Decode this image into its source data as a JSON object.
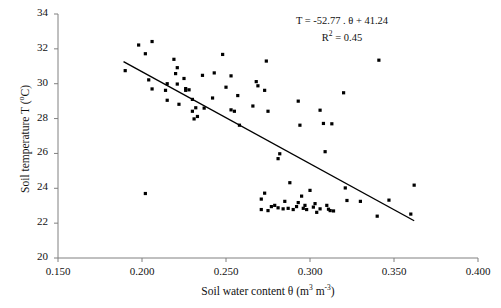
{
  "chart_data": {
    "type": "scatter",
    "title": "",
    "xlabel": "Soil water content θ (m³ m⁻³)",
    "ylabel": "Soil temperature T (ºC)",
    "xlim": [
      0.15,
      0.4
    ],
    "ylim": [
      20,
      34
    ],
    "xticks": [
      "0.150",
      "0.200",
      "0.250",
      "0.300",
      "0.350",
      "0.400"
    ],
    "xtick_values": [
      0.15,
      0.2,
      0.25,
      0.3,
      0.35,
      0.4
    ],
    "yticks": [
      "20",
      "22",
      "24",
      "26",
      "28",
      "30",
      "32",
      "34"
    ],
    "ytick_values": [
      20,
      22,
      24,
      26,
      28,
      30,
      32,
      34
    ],
    "grid": false,
    "legend": null,
    "marker": "square",
    "marker_color": "#000000",
    "annotation_equation": "T = -52.77 . θ + 41.24",
    "annotation_r2_prefix": "R",
    "annotation_r2_sup": "2",
    "annotation_r2_value": " = 0.45",
    "fit_line": {
      "slope": -52.77,
      "intercept": 41.24,
      "r_squared": 0.45,
      "x_start": 0.189,
      "x_end": 0.362,
      "color": "#000000"
    },
    "points": [
      [
        0.19,
        30.75
      ],
      [
        0.198,
        32.22
      ],
      [
        0.202,
        31.72
      ],
      [
        0.202,
        23.7
      ],
      [
        0.204,
        30.22
      ],
      [
        0.206,
        32.42
      ],
      [
        0.206,
        29.7
      ],
      [
        0.214,
        29.62
      ],
      [
        0.215,
        30.0
      ],
      [
        0.215,
        29.05
      ],
      [
        0.219,
        31.4
      ],
      [
        0.22,
        30.58
      ],
      [
        0.221,
        30.92
      ],
      [
        0.221,
        29.98
      ],
      [
        0.222,
        28.82
      ],
      [
        0.225,
        30.3
      ],
      [
        0.226,
        29.72
      ],
      [
        0.226,
        29.62
      ],
      [
        0.228,
        29.65
      ],
      [
        0.23,
        29.1
      ],
      [
        0.23,
        28.42
      ],
      [
        0.231,
        27.98
      ],
      [
        0.232,
        28.62
      ],
      [
        0.233,
        28.12
      ],
      [
        0.236,
        30.48
      ],
      [
        0.237,
        28.6
      ],
      [
        0.242,
        29.18
      ],
      [
        0.243,
        30.62
      ],
      [
        0.248,
        31.68
      ],
      [
        0.25,
        29.8
      ],
      [
        0.253,
        30.45
      ],
      [
        0.253,
        28.5
      ],
      [
        0.255,
        28.42
      ],
      [
        0.257,
        29.32
      ],
      [
        0.258,
        27.62
      ],
      [
        0.266,
        28.72
      ],
      [
        0.268,
        30.12
      ],
      [
        0.269,
        29.88
      ],
      [
        0.271,
        23.38
      ],
      [
        0.271,
        22.78
      ],
      [
        0.273,
        29.62
      ],
      [
        0.273,
        23.72
      ],
      [
        0.274,
        31.3
      ],
      [
        0.275,
        28.42
      ],
      [
        0.275,
        22.72
      ],
      [
        0.277,
        22.95
      ],
      [
        0.279,
        23.02
      ],
      [
        0.281,
        25.7
      ],
      [
        0.281,
        22.88
      ],
      [
        0.282,
        25.98
      ],
      [
        0.284,
        22.82
      ],
      [
        0.285,
        23.25
      ],
      [
        0.287,
        22.85
      ],
      [
        0.288,
        24.32
      ],
      [
        0.29,
        22.78
      ],
      [
        0.292,
        22.95
      ],
      [
        0.293,
        29.0
      ],
      [
        0.293,
        23.18
      ],
      [
        0.294,
        27.62
      ],
      [
        0.295,
        23.55
      ],
      [
        0.296,
        22.85
      ],
      [
        0.297,
        23.02
      ],
      [
        0.298,
        22.78
      ],
      [
        0.3,
        23.88
      ],
      [
        0.302,
        22.92
      ],
      [
        0.303,
        23.12
      ],
      [
        0.304,
        22.62
      ],
      [
        0.306,
        28.48
      ],
      [
        0.306,
        22.82
      ],
      [
        0.308,
        27.72
      ],
      [
        0.309,
        26.1
      ],
      [
        0.31,
        23.02
      ],
      [
        0.311,
        22.8
      ],
      [
        0.312,
        22.72
      ],
      [
        0.313,
        27.7
      ],
      [
        0.314,
        22.7
      ],
      [
        0.32,
        29.48
      ],
      [
        0.321,
        24.02
      ],
      [
        0.322,
        23.3
      ],
      [
        0.33,
        23.25
      ],
      [
        0.34,
        22.4
      ],
      [
        0.341,
        31.35
      ],
      [
        0.347,
        23.32
      ],
      [
        0.36,
        22.52
      ],
      [
        0.362,
        24.18
      ]
    ]
  }
}
